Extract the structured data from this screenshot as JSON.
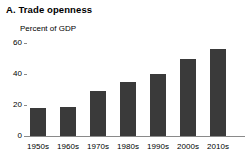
{
  "panel": {
    "title": "A. Trade openness"
  },
  "chart_data": {
    "type": "bar",
    "title": "A. Trade openness",
    "subtitle": "Percent of GDP",
    "xlabel": "",
    "ylabel": "Percent of GDP",
    "categories": [
      "1950s",
      "1960s",
      "1970s",
      "1980s",
      "1990s",
      "2000s",
      "2010s"
    ],
    "values": [
      18,
      19,
      29,
      35,
      40,
      50,
      56
    ],
    "ylim": [
      0,
      60
    ],
    "yticks": [
      0,
      20,
      40,
      60
    ],
    "ytick_labels": [
      "0",
      "20",
      "40",
      "60"
    ],
    "grid": false,
    "legend": null,
    "bar_color": "#3a3a3a",
    "axis_color": "#8a8a8a",
    "background": "#ffffff"
  }
}
